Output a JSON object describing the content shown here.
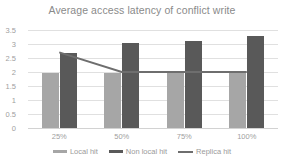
{
  "chart_data": {
    "type": "bar",
    "title": "Average access latency of conflict write",
    "xlabel": "",
    "ylabel": "",
    "categories": [
      "25%",
      "50%",
      "75%",
      "100%"
    ],
    "ylim": [
      0,
      3.5
    ],
    "yticks": [
      "0",
      "0.5",
      "1",
      "1.5",
      "2",
      "2.5",
      "3",
      "3.5"
    ],
    "ytick_values": [
      0,
      0.5,
      1,
      1.5,
      2,
      2.5,
      3,
      3.5
    ],
    "grid": true,
    "legend_position": "bottom",
    "series": [
      {
        "name": "Local hit",
        "type": "bar",
        "color": "#a6a6a6",
        "values": [
          1.97,
          1.95,
          1.95,
          1.99
        ]
      },
      {
        "name": "Non local hit",
        "type": "bar",
        "color": "#595959",
        "values": [
          2.68,
          3.04,
          3.11,
          3.3
        ]
      },
      {
        "name": "Replica hit",
        "type": "line",
        "color": "#6e6e6e",
        "values": [
          2.7,
          2.0,
          2.0,
          2.0
        ]
      }
    ]
  }
}
